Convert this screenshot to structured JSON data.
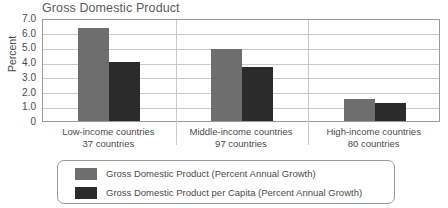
{
  "chart_data": {
    "type": "bar",
    "title": "Gross Domestic Product",
    "xlabel": "",
    "ylabel": "Percent",
    "ylim": [
      0,
      7.0
    ],
    "yticks": [
      "0",
      "1.0",
      "2.0",
      "3.0",
      "4.0",
      "5.0",
      "6.0",
      "7.0"
    ],
    "ytick_values": [
      0,
      1.0,
      2.0,
      3.0,
      4.0,
      5.0,
      6.0,
      7.0
    ],
    "grid": true,
    "legend_position": "bottom",
    "categories": [
      "Low-income countries",
      "Middle-income countries",
      "High-income countries"
    ],
    "category_sublabels": [
      "37 countries",
      "97 countries",
      "80 countries"
    ],
    "series": [
      {
        "name": "Gross Domestic Product (Percent Annual Growth)",
        "color": "#6e6e6e",
        "values": [
          6.3,
          4.9,
          1.5
        ]
      },
      {
        "name": "Gross Domestic Product per Capita (Percent Annual Growth)",
        "color": "#2b2b2b",
        "values": [
          4.0,
          3.7,
          1.25
        ]
      }
    ]
  },
  "colors": {
    "series_1": "#6e6e6e",
    "series_2": "#2b2b2b",
    "grid": "#c9c9c9",
    "frame": "#9a9a9a",
    "text": "#4a4a4a",
    "title": "#5a5a5a"
  }
}
